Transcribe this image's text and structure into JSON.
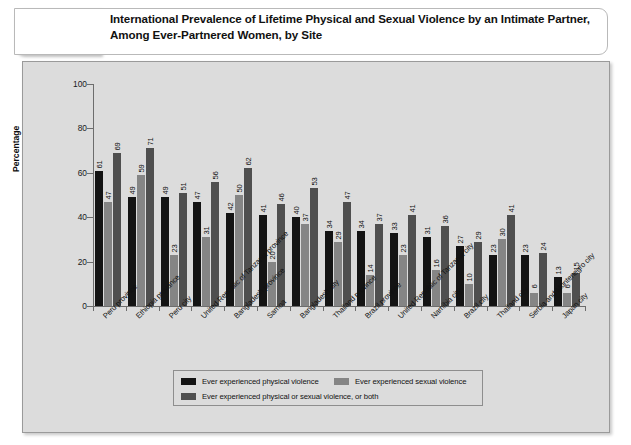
{
  "header": {
    "badge": "Exhibit 2.1",
    "title": "International Prevalence of Lifetime Physical and Sexual Violence by an Intimate Partner, Among Ever-Partnered Women, by Site"
  },
  "chart_data": {
    "type": "bar",
    "title": "International Prevalence of Lifetime Physical and Sexual Violence by an Intimate Partner, Among Ever-Partnered Women, by Site",
    "xlabel": "",
    "ylabel": "Percentage",
    "ylim": [
      0,
      100
    ],
    "yticks": [
      0,
      20,
      40,
      60,
      80,
      100
    ],
    "grid": false,
    "legend_position": "bottom",
    "categories": [
      "Peru province",
      "Ethiopia provance",
      "Peru city",
      "United Republic of Tanzania province",
      "Bangladesh province",
      "Samoa",
      "Bangladesh city",
      "Thailand province",
      "Brazil province",
      "United Republic of Tanzania city",
      "Namibia city",
      "Brazil city",
      "Thailand city",
      "Serbia and Montenegro city",
      "Japan city"
    ],
    "series": [
      {
        "name": "Ever experienced physical violence",
        "color": "#141414",
        "values": [
          61,
          49,
          49,
          47,
          42,
          41,
          40,
          34,
          34,
          33,
          31,
          27,
          23,
          23,
          13
        ]
      },
      {
        "name": "Ever experienced sexual violence",
        "color": "#858585",
        "values": [
          47,
          59,
          23,
          31,
          50,
          20,
          37,
          29,
          14,
          23,
          16,
          10,
          30,
          6,
          6
        ]
      },
      {
        "name": "Ever experienced physical or sexual violence, or both",
        "color": "#4f4f4f",
        "values": [
          69,
          71,
          51,
          56,
          62,
          46,
          53,
          47,
          37,
          41,
          36,
          29,
          41,
          24,
          15
        ]
      }
    ]
  }
}
